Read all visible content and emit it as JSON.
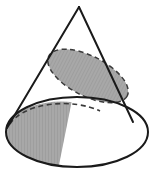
{
  "figure": {
    "name": "cone-with-conic-sections",
    "title": "Cone with elliptical cross-section and shaded base sector",
    "width": 155,
    "height": 176,
    "background_color": "#ffffff"
  },
  "colors": {
    "outline": "#1a1a1a",
    "shade_fill": "#a8a8a8",
    "shade_fill_light": "#b0b0b0",
    "dashed_stroke": "#3a3a3a",
    "background": "#ffffff"
  },
  "geometry": {
    "apex": {
      "x": 79,
      "y": 7
    },
    "base_ellipse": {
      "cx": 77,
      "cy": 132,
      "rx": 71,
      "ry": 35
    },
    "left_generatrix": {
      "x1": 79,
      "y1": 7,
      "x2": 7,
      "y2": 128
    },
    "right_generatrix": {
      "x1": 79,
      "y1": 7,
      "x2": 133,
      "y2": 122
    },
    "cut_ellipse": {
      "cx": 88,
      "cy": 76,
      "rx": 44,
      "ry": 20,
      "rotation_deg": 27
    },
    "base_sector": {
      "description": "shaded wedge region of base bounded by dashed arc above and rear ellipse arc below"
    }
  },
  "elements": {
    "apex_label": "apex",
    "cone_label": "cone",
    "cut_plane_label": "elliptical cross-section",
    "sector_label": "shaded base sector",
    "base_label": "base circle"
  }
}
